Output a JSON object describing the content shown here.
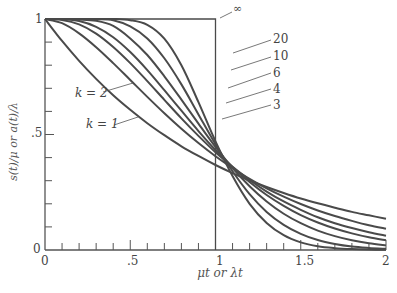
{
  "chart_data": {
    "type": "line",
    "title": "",
    "xlabel": "μt or λt",
    "ylabel": "s(t)/μ or a(t)/λ",
    "xlim": [
      0,
      2
    ],
    "ylim": [
      0,
      1
    ],
    "x_ticks": [
      "0",
      ".5",
      "1",
      "1.5",
      "2"
    ],
    "y_ticks": [
      "0",
      ".5",
      "1"
    ],
    "grid": false,
    "legend": "inline labels",
    "x": [
      0,
      0.1,
      0.2,
      0.3,
      0.4,
      0.5,
      0.6,
      0.7,
      0.8,
      0.9,
      1.0,
      1.1,
      1.2,
      1.3,
      1.4,
      1.5,
      1.6,
      1.7,
      1.8,
      1.9,
      2.0
    ],
    "series": [
      {
        "name": "k = 1",
        "values": [
          1,
          0.905,
          0.819,
          0.741,
          0.67,
          0.607,
          0.549,
          0.497,
          0.449,
          0.407,
          0.368,
          0.333,
          0.301,
          0.273,
          0.247,
          0.223,
          0.202,
          0.183,
          0.165,
          0.15,
          0.135
        ]
      },
      {
        "name": "k = 2",
        "values": [
          1,
          0.982,
          0.938,
          0.878,
          0.809,
          0.736,
          0.663,
          0.592,
          0.525,
          0.463,
          0.406,
          0.355,
          0.308,
          0.267,
          0.231,
          0.199,
          0.171,
          0.147,
          0.126,
          0.107,
          0.092
        ]
      },
      {
        "name": "3",
        "values": [
          1,
          0.996,
          0.977,
          0.937,
          0.879,
          0.809,
          0.731,
          0.65,
          0.57,
          0.494,
          0.423,
          0.36,
          0.303,
          0.253,
          0.21,
          0.174,
          0.142,
          0.116,
          0.095,
          0.077,
          0.062
        ]
      },
      {
        "name": "4",
        "values": [
          1,
          0.999,
          0.991,
          0.966,
          0.921,
          0.857,
          0.779,
          0.692,
          0.603,
          0.515,
          0.433,
          0.359,
          0.294,
          0.238,
          0.191,
          0.151,
          0.119,
          0.093,
          0.072,
          0.055,
          0.042
        ]
      },
      {
        "name": "6",
        "values": [
          1,
          1.0,
          0.998,
          0.992,
          0.97,
          0.916,
          0.844,
          0.752,
          0.651,
          0.547,
          0.446,
          0.355,
          0.276,
          0.21,
          0.157,
          0.116,
          0.084,
          0.06,
          0.042,
          0.029,
          0.02
        ]
      },
      {
        "name": "10",
        "values": [
          1,
          1.0,
          1.0,
          0.999,
          0.995,
          0.968,
          0.916,
          0.83,
          0.717,
          0.587,
          0.458,
          0.341,
          0.242,
          0.165,
          0.109,
          0.07,
          0.043,
          0.026,
          0.015,
          0.009,
          0.005
        ]
      },
      {
        "name": "20",
        "values": [
          1,
          1.0,
          1.0,
          1.0,
          1.0,
          0.995,
          0.975,
          0.915,
          0.8,
          0.64,
          0.47,
          0.32,
          0.2,
          0.117,
          0.064,
          0.033,
          0.016,
          0.008,
          0.004,
          0.002,
          0.001
        ]
      },
      {
        "name": "∞",
        "values": [
          1,
          1,
          1,
          1,
          1,
          1,
          1,
          1,
          1,
          1,
          1,
          0,
          0,
          0,
          0,
          0,
          0,
          0,
          0,
          0,
          0
        ]
      }
    ],
    "annotations": [
      "k = 1",
      "k = 2",
      "3",
      "4",
      "6",
      "10",
      "20",
      "∞"
    ]
  },
  "labels": {
    "y0": "0",
    "y05": ".5",
    "y1": "1",
    "x0": "0",
    "x05": ".5",
    "x1": "1",
    "x15": "1.5",
    "x2": "2",
    "xlabel": "μt or λt",
    "ylabel": "s(t)/μ or a(t)/λ",
    "k1": "k = 1",
    "k2": "k = 2",
    "k3": "3",
    "k4": "4",
    "k6": "6",
    "k10": "10",
    "k20": "20",
    "kinf": "∞"
  }
}
